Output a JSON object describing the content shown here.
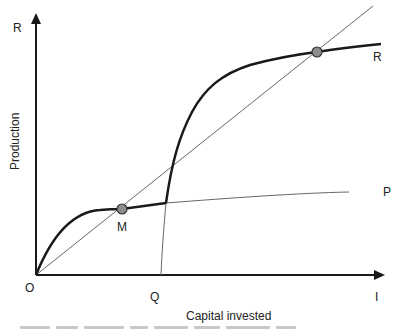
{
  "diagram": {
    "axes": {
      "y_axis_end_label": "R",
      "x_axis_end_label": "I",
      "origin_label": "O",
      "y_title": "Production",
      "x_title": "Capital invested"
    },
    "x_marker_label": "Q",
    "curves": [
      {
        "name": "P",
        "label": "P",
        "style": "thin"
      },
      {
        "name": "R",
        "label": "R",
        "style": "thick"
      },
      {
        "name": "diagonal",
        "label": "",
        "style": "thin"
      }
    ],
    "points": [
      {
        "name": "M",
        "label": "M",
        "color": "#8c8c8c"
      },
      {
        "name": "R-intersection",
        "label": "",
        "color": "#8c8c8c"
      }
    ],
    "colors": {
      "line": "#1a1a1a",
      "thin_line": "#555555",
      "point_fill": "#8c8c8c"
    }
  }
}
